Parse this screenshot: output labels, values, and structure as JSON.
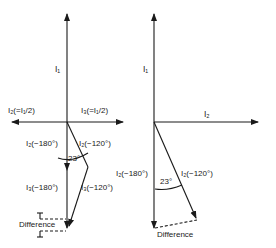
{
  "diagram": {
    "left": {
      "labels": {
        "i1": "I₁",
        "i2_half": "I₂(=I₁/2)",
        "i3_half": "I₃(=I₁/2)",
        "i2_180": "I₂(−180°)",
        "i2_120": "I₂(−120°)",
        "i3_180": "I₃(−180°)",
        "i3_120": "I₃(−120°)",
        "angle": "23°",
        "difference": "Difference"
      }
    },
    "right": {
      "labels": {
        "i1": "I₁",
        "i2": "I₂",
        "i2_180": "I₂(−180°)",
        "i2_120": "I₂(−120°)",
        "angle": "23°",
        "difference": "Difference"
      }
    },
    "colors": {
      "line": "#1a1a1a",
      "background": "#ffffff"
    }
  }
}
